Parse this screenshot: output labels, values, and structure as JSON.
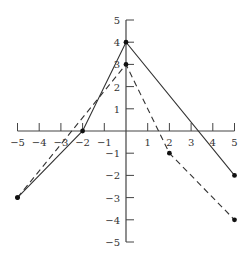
{
  "chart_data": {
    "type": "line",
    "title": "",
    "xlabel": "",
    "ylabel": "",
    "xlim": [
      -5,
      5
    ],
    "ylim": [
      -5,
      5
    ],
    "grid": false,
    "legend": null,
    "x_ticks": [
      -5,
      -4,
      -3,
      -2,
      -1,
      1,
      2,
      3,
      4,
      5
    ],
    "x_tick_labels": [
      "−5",
      "−4",
      "−3",
      "−2",
      "−1",
      "1",
      "2",
      "3",
      "4",
      "5"
    ],
    "y_ticks": [
      5,
      4,
      3,
      2,
      1,
      -1,
      -2,
      -3,
      -4,
      -5
    ],
    "y_tick_labels": [
      "5",
      "4",
      "3",
      "2",
      "1",
      "−1",
      "−2",
      "−3",
      "−4",
      "−5"
    ],
    "series": [
      {
        "name": "solid",
        "style": "solid",
        "color": "#333333",
        "points": [
          [
            -5,
            -3
          ],
          [
            -2,
            0
          ],
          [
            0,
            4
          ],
          [
            5,
            -2
          ]
        ]
      },
      {
        "name": "dashed",
        "style": "dashed",
        "color": "#333333",
        "points": [
          [
            -5,
            -3
          ],
          [
            0,
            3
          ],
          [
            2,
            -1
          ],
          [
            5,
            -4
          ]
        ]
      }
    ]
  }
}
